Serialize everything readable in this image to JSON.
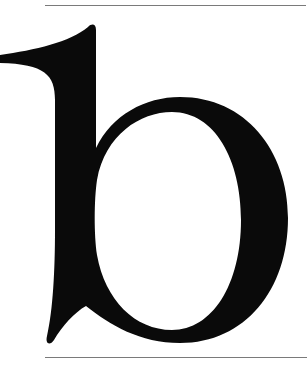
{
  "specimen": {
    "glyph": "b",
    "glyph_color": "#0a0a0a",
    "rule_color": "#7a7a7a",
    "background": "#ffffff"
  }
}
